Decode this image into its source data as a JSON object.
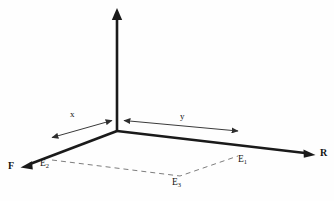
{
  "diagram": {
    "background_color": "#fefefe",
    "axis_color": "#1a1a1a",
    "dimension_color": "#3a3a3a",
    "dashed_color": "#7d7d7d",
    "axes": [
      {
        "id": "vertical-axis",
        "label": "",
        "from": [
          117,
          130
        ],
        "to": [
          117,
          10
        ],
        "arrow": "up"
      },
      {
        "id": "front-left-axis",
        "label": "F",
        "from": [
          117,
          130
        ],
        "to": [
          22,
          167
        ],
        "arrow": "down-left"
      },
      {
        "id": "right-axis",
        "label": "R",
        "from": [
          117,
          130
        ],
        "to": [
          314,
          155
        ],
        "arrow": "down-right"
      }
    ],
    "axis_labels": {
      "front": "F",
      "right": "R"
    },
    "dimensions": [
      {
        "id": "x-dimension",
        "label": "x",
        "from": [
          50,
          138
        ],
        "to": [
          114,
          120
        ],
        "arrow": "both"
      },
      {
        "id": "y-dimension",
        "label": "y",
        "from": [
          122,
          120
        ],
        "to": [
          240,
          131
        ],
        "arrow": "both"
      }
    ],
    "dimension_labels": {
      "x": "x",
      "y": "y"
    },
    "points": [
      {
        "id": "E1",
        "label": "E",
        "subscript": "1",
        "at": [
          232,
          152
        ]
      },
      {
        "id": "E2",
        "label": "E",
        "subscript": "2",
        "at": [
          52,
          160
        ]
      },
      {
        "id": "E3",
        "label": "E",
        "subscript": "3",
        "at": [
          180,
          176
        ]
      }
    ],
    "dashed_path": {
      "id": "base-parallelogram",
      "vertices": [
        [
          52,
          160
        ],
        [
          180,
          176
        ],
        [
          238,
          156
        ]
      ]
    }
  }
}
